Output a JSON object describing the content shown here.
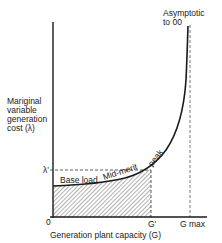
{
  "diagram": {
    "type": "marginal-cost-curve",
    "y_axis_label": [
      "Mariginal",
      "variable",
      "generation",
      "cost (λ)"
    ],
    "x_axis_label": "Generation plant capacity (G)",
    "origin_label": "0",
    "lambda_prime_label": "λ'",
    "g_prime_label": "G'",
    "g_max_label": "G max",
    "asymptote_label": [
      "Asymptotic",
      "to 00"
    ],
    "curve_segments": [
      "Base load",
      "Mid-merit",
      "peak"
    ],
    "colors": {
      "line": "#1a1a1a",
      "hatch": "#555555",
      "background": "#ffffff"
    }
  }
}
